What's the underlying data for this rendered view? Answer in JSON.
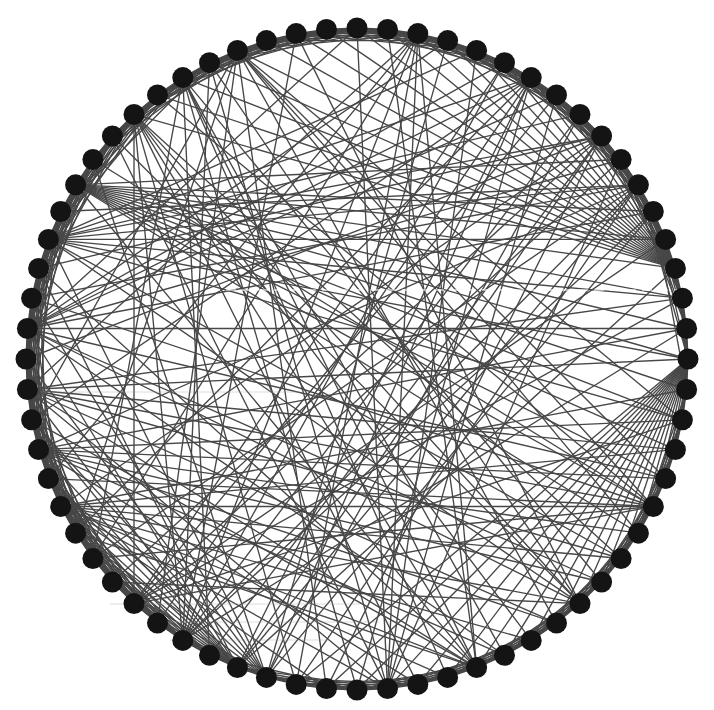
{
  "figure": {
    "title": "",
    "layout": "circular",
    "background_color": "#ffffff",
    "node_color": "#141414",
    "edge_color": "#474747"
  },
  "chart_data": {
    "type": "network",
    "layout": "circle",
    "title": "",
    "node_count": 68,
    "canvas": {
      "width": 714,
      "height": 710
    },
    "center": {
      "x": 357,
      "y": 359
    },
    "radius": 331,
    "node_radius": 10.5,
    "start_angle_deg": 0,
    "direction": "clockwise-from-top",
    "ring_lattice_offsets": [
      1,
      2,
      3
    ],
    "dense_rim_ranges": [
      {
        "from": 38,
        "to": 56,
        "extra_offsets": [
          4,
          5,
          6,
          7
        ]
      },
      {
        "from": 58,
        "to": 12,
        "extra_offsets": [
          4,
          5,
          6
        ]
      },
      {
        "from": 18,
        "to": 34,
        "extra_offsets": [
          4,
          5
        ]
      }
    ],
    "hubs": [
      {
        "node": 17,
        "targets": [
          20,
          21,
          22,
          23,
          24,
          25,
          26,
          27,
          28,
          29,
          30,
          31,
          32,
          33,
          34,
          35,
          36
        ]
      },
      {
        "node": 14,
        "targets": [
          60,
          61,
          62,
          63,
          64,
          65,
          66,
          67,
          0,
          1,
          2,
          3,
          4,
          5,
          6,
          7,
          8
        ]
      },
      {
        "node": 57,
        "targets": [
          10,
          12,
          13,
          14,
          15,
          16,
          17,
          18,
          19,
          20,
          21,
          22,
          23
        ]
      },
      {
        "node": 55,
        "targets": [
          4,
          6,
          8,
          9,
          11,
          13,
          15,
          17,
          19,
          24,
          26
        ]
      },
      {
        "node": 38,
        "targets": [
          44,
          45,
          46,
          47,
          48,
          49,
          50,
          52,
          54,
          9,
          11,
          14,
          6
        ]
      },
      {
        "node": 37,
        "targets": [
          43,
          45,
          47,
          49,
          51,
          53,
          55,
          58,
          3,
          8,
          12
        ]
      },
      {
        "node": 46,
        "targets": [
          18,
          20,
          22,
          24,
          26,
          28,
          30,
          31,
          33,
          35
        ]
      },
      {
        "node": 48,
        "targets": [
          16,
          19,
          21,
          23,
          25,
          27,
          29,
          32
        ]
      },
      {
        "node": 50,
        "targets": [
          15,
          17,
          20,
          24,
          27,
          30,
          33
        ]
      },
      {
        "node": 60,
        "targets": [
          24,
          26,
          28,
          30,
          32,
          36,
          40,
          42
        ]
      },
      {
        "node": 62,
        "targets": [
          25,
          29,
          31,
          34,
          39,
          44
        ]
      },
      {
        "node": 2,
        "targets": [
          30,
          33,
          36,
          40,
          44,
          47,
          50
        ]
      },
      {
        "node": 6,
        "targets": [
          34,
          37,
          41,
          45,
          49,
          52
        ]
      },
      {
        "node": 9,
        "targets": [
          35,
          39,
          43,
          46,
          51,
          54
        ]
      },
      {
        "node": 11,
        "targets": [
          36,
          40,
          44,
          48,
          53,
          56
        ]
      },
      {
        "node": 22,
        "targets": [
          42,
          44,
          47,
          50,
          53,
          58,
          61,
          64
        ]
      },
      {
        "node": 26,
        "targets": [
          43,
          46,
          52,
          55,
          59,
          63,
          66
        ]
      },
      {
        "node": 30,
        "targets": [
          45,
          49,
          54,
          57,
          62,
          1
        ]
      },
      {
        "node": 42,
        "targets": [
          5,
          7,
          10,
          13,
          15,
          19
        ]
      },
      {
        "node": 52,
        "targets": [
          0,
          3,
          5,
          7,
          10,
          12,
          16,
          21,
          25,
          29
        ]
      },
      {
        "node": 64,
        "targets": [
          19,
          21,
          23,
          27,
          35,
          41,
          45,
          49
        ]
      },
      {
        "node": 33,
        "targets": [
          0,
          4,
          7,
          10,
          59,
          63
        ]
      },
      {
        "node": 40,
        "targets": [
          2,
          5,
          8,
          12,
          16,
          63,
          66
        ]
      }
    ],
    "artifacts": [
      {
        "type": "light-streak",
        "y": 290,
        "x1": 210,
        "x2": 680
      },
      {
        "type": "dark-streak",
        "y": 604,
        "x1": 110,
        "x2": 360
      },
      {
        "type": "dark-streak",
        "y": 622,
        "x1": 150,
        "x2": 380
      },
      {
        "type": "dark-streak",
        "y": 640,
        "x1": 170,
        "x2": 330
      },
      {
        "type": "dark-streak",
        "y": 392,
        "x1": 40,
        "x2": 300
      }
    ]
  }
}
